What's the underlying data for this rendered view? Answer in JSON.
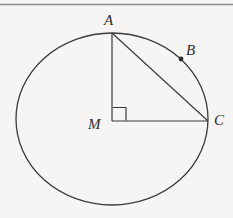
{
  "figure": {
    "background_color": "#f6f5f3",
    "stroke_color": "#3a3a3a",
    "label_color": "#2b2b2b",
    "top_rule": {
      "name": "page-edge-rule",
      "color": "#8d8d8d",
      "y": 4,
      "thickness": 1.4
    },
    "circle": {
      "center_label": "M",
      "center_x": 112,
      "center_y": 119,
      "radius_x": 96,
      "radius_y": 86,
      "stroke_width": 1.3
    },
    "points": [
      {
        "id": "A",
        "label": "A",
        "x": 112,
        "y": 33,
        "description": "top of circle"
      },
      {
        "id": "B",
        "label": "B",
        "x": 181,
        "y": 59,
        "description": "marked point on arc between A and C"
      },
      {
        "id": "C",
        "label": "C",
        "x": 208,
        "y": 121,
        "description": "right of circle"
      },
      {
        "id": "M",
        "label": "M",
        "x": 112,
        "y": 121,
        "description": "center of circle"
      }
    ],
    "segments": [
      {
        "id": "MA",
        "from": "M",
        "to": "A",
        "x1": 112,
        "y1": 121,
        "x2": 112,
        "y2": 33
      },
      {
        "id": "MC",
        "from": "M",
        "to": "C",
        "x1": 112,
        "y1": 121,
        "x2": 208,
        "y2": 121
      },
      {
        "id": "AC",
        "from": "A",
        "to": "C",
        "x1": 112,
        "y1": 33,
        "x2": 208,
        "y2": 121
      }
    ],
    "right_angle_marker": {
      "at_point": "M",
      "x": 113,
      "y": 107,
      "size": 13,
      "description": "square mark indicating 90 degrees between MA and MC"
    },
    "point_marker_B": {
      "x": 181,
      "y": 59,
      "radius": 2.4
    },
    "labels": {
      "A": "A",
      "B": "B",
      "C": "C",
      "M": "M"
    }
  }
}
